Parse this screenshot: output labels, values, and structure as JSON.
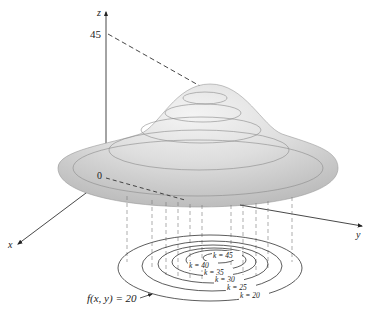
{
  "figure": {
    "axes": {
      "z_label": "z",
      "x_label": "x",
      "y_label": "y",
      "origin_label": "0",
      "z_tick": "45"
    },
    "level_curves": [
      {
        "k": 45,
        "label": "k = 45"
      },
      {
        "k": 40,
        "label": "k = 40"
      },
      {
        "k": 35,
        "label": "k = 35"
      },
      {
        "k": 30,
        "label": "k = 30"
      },
      {
        "k": 25,
        "label": "k = 25"
      },
      {
        "k": 20,
        "label": "k = 20"
      }
    ],
    "annotation": "f(x, y) = 20",
    "colors": {
      "surface_fill": "#d9d9d9",
      "surface_highlight": "#f2f2f2",
      "lines": "#333333"
    }
  }
}
